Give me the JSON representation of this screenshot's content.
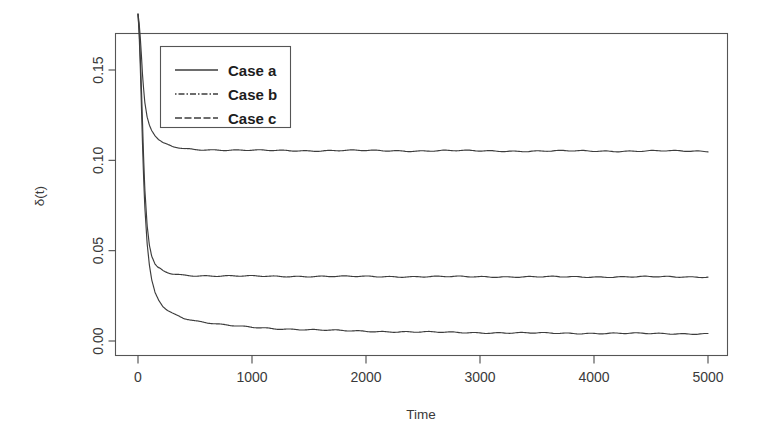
{
  "chart_data": {
    "type": "line",
    "title": "",
    "xlabel": "Time",
    "ylabel": "δ(t)",
    "xlim": [
      0,
      5200
    ],
    "ylim": [
      0.0,
      0.182
    ],
    "grid": false,
    "legend_position": "top-left-inside",
    "xticks": [
      0,
      1000,
      2000,
      3000,
      4000,
      5000
    ],
    "xtick_labels": [
      "0",
      "1000",
      "2000",
      "3000",
      "4000",
      "5000"
    ],
    "yticks": [
      0.0,
      0.05,
      0.1,
      0.15
    ],
    "ytick_labels": [
      "0.00",
      "0.05",
      "0.10",
      "0.15"
    ],
    "series": [
      {
        "name": "Case a",
        "linestyle": "solid",
        "color": "#3d3d3d",
        "plateau_value": 0.105,
        "start_value": 0.181,
        "x": [
          0,
          10,
          20,
          30,
          40,
          50,
          60,
          80,
          100,
          120,
          150,
          180,
          220,
          260,
          300,
          400,
          500,
          700,
          900,
          1200,
          1500,
          1800,
          2100,
          2400,
          2700,
          3000,
          3400,
          3800,
          4200,
          4600,
          5000
        ],
        "y": [
          0.181,
          0.176,
          0.168,
          0.158,
          0.147,
          0.139,
          0.132,
          0.124,
          0.1195,
          0.1165,
          0.1135,
          0.1115,
          0.1095,
          0.1085,
          0.1075,
          0.1065,
          0.106,
          0.1058,
          0.1056,
          0.1054,
          0.1053,
          0.1055,
          0.1053,
          0.1052,
          0.1054,
          0.1052,
          0.1051,
          0.1052,
          0.1051,
          0.1052,
          0.105
        ]
      },
      {
        "name": "Case b",
        "linestyle": "dotdash",
        "color": "#3d3d3d",
        "plateau_value": 0.0355,
        "start_value": 0.181,
        "x": [
          0,
          10,
          20,
          30,
          40,
          50,
          60,
          80,
          100,
          120,
          150,
          180,
          220,
          260,
          300,
          400,
          500,
          700,
          900,
          1200,
          1500,
          1800,
          2100,
          2400,
          2700,
          3000,
          3400,
          3800,
          4200,
          4600,
          5000
        ],
        "y": [
          0.181,
          0.172,
          0.158,
          0.14,
          0.12,
          0.1,
          0.084,
          0.064,
          0.053,
          0.047,
          0.0425,
          0.0405,
          0.0388,
          0.0378,
          0.0372,
          0.0365,
          0.0362,
          0.036,
          0.0359,
          0.0358,
          0.0358,
          0.0357,
          0.0357,
          0.0356,
          0.0356,
          0.0356,
          0.0355,
          0.0355,
          0.0355,
          0.0355,
          0.0355
        ]
      },
      {
        "name": "Case c",
        "linestyle": "dashed",
        "color": "#3d3d3d",
        "plateau_value": 0.004,
        "start_value": 0.181,
        "x": [
          0,
          10,
          20,
          30,
          40,
          50,
          60,
          80,
          100,
          120,
          150,
          180,
          220,
          260,
          300,
          400,
          500,
          700,
          900,
          1200,
          1500,
          1800,
          2100,
          2400,
          2700,
          3000,
          3400,
          3800,
          4200,
          4600,
          5000
        ],
        "y": [
          0.181,
          0.17,
          0.152,
          0.13,
          0.108,
          0.089,
          0.074,
          0.054,
          0.042,
          0.034,
          0.0268,
          0.0228,
          0.0192,
          0.017,
          0.0155,
          0.0128,
          0.0112,
          0.0092,
          0.008,
          0.0069,
          0.0062,
          0.0057,
          0.0053,
          0.005,
          0.0048,
          0.0046,
          0.0044,
          0.0043,
          0.0042,
          0.0041,
          0.004
        ]
      }
    ]
  },
  "legend": {
    "entries": [
      {
        "label": "Case a"
      },
      {
        "label": "Case b"
      },
      {
        "label": "Case c"
      }
    ]
  },
  "axes": {
    "x_title": "Time",
    "y_title": "δ(t)"
  }
}
